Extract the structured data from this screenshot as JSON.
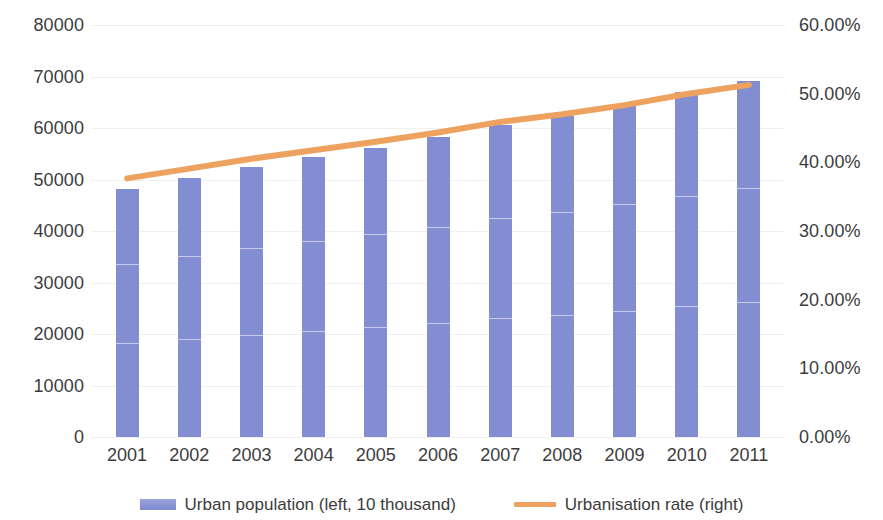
{
  "chart_data": {
    "type": "bar",
    "title": "",
    "subtitle": "",
    "xlabel": "",
    "ylabel": "",
    "categories": [
      "2001",
      "2002",
      "2003",
      "2004",
      "2005",
      "2006",
      "2007",
      "2008",
      "2009",
      "2010",
      "2011"
    ],
    "grid": true,
    "legend_position": "bottom",
    "left_axis": {
      "name": "Urban population (left, 10 thousand)",
      "ylim": [
        0,
        80000
      ],
      "tick_step": 10000,
      "ticks": [
        "80000",
        "70000",
        "60000",
        "50000",
        "40000",
        "30000",
        "20000",
        "10000",
        "0"
      ],
      "tick_values": [
        80000,
        70000,
        60000,
        50000,
        40000,
        30000,
        20000,
        10000,
        0
      ]
    },
    "right_axis": {
      "name": "Urbanisation rate (right)",
      "ylim": [
        0,
        60
      ],
      "tick_step": 10,
      "ticks": [
        "60.00%",
        "50.00%",
        "40.00%",
        "30.00%",
        "20.00%",
        "10.00%",
        "0.00%"
      ],
      "tick_values": [
        60,
        50,
        40,
        30,
        20,
        10,
        0
      ]
    },
    "series": [
      {
        "name": "Urban population (left, 10 thousand)",
        "type": "bar",
        "axis": "left",
        "color": "#838ed2",
        "values": [
          48064,
          50212,
          52376,
          54283,
          56212,
          58288,
          60633,
          62403,
          64512,
          66978,
          69079
        ]
      },
      {
        "name": "Urbanisation rate (right)",
        "type": "line",
        "axis": "right",
        "color": "#eda35f",
        "values": [
          37.66,
          39.09,
          40.53,
          41.76,
          42.99,
          44.34,
          45.89,
          46.99,
          48.34,
          49.95,
          51.27
        ]
      }
    ]
  },
  "legend": {
    "items": [
      {
        "label": "Urban population (left, 10 thousand)",
        "marker": "bar-swatch",
        "color": "#838ed2"
      },
      {
        "label": "Urbanisation rate (right)",
        "marker": "line-swatch",
        "color": "#eda35f"
      }
    ]
  },
  "colors": {
    "bar": "#838ed2",
    "line": "#eda35f",
    "text": "#3c3c3c",
    "gridline": "#f0f0f0",
    "background": "#ffffff"
  }
}
